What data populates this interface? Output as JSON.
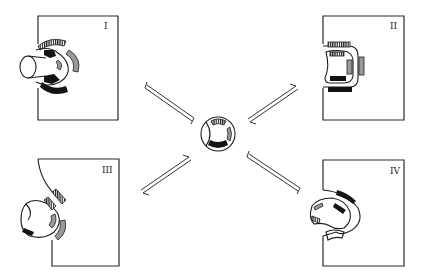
{
  "diagram": {
    "colors": {
      "ink": "#1e1e1e",
      "filled_dark": "#141414",
      "filled_grey": "#9a9a9a",
      "background": "#ffffff"
    },
    "center_node": {
      "label": "",
      "cx": 218,
      "cy": 134,
      "r": 17
    },
    "panels": [
      {
        "id": "I",
        "label": "I",
        "position": "top-left"
      },
      {
        "id": "II",
        "label": "II",
        "position": "top-right"
      },
      {
        "id": "III",
        "label": "III",
        "position": "bottom-left"
      },
      {
        "id": "IV",
        "label": "IV",
        "position": "bottom-right"
      }
    ],
    "arrows": [
      {
        "from": "center",
        "to": "I",
        "type": "reversible-equilibrium"
      },
      {
        "from": "center",
        "to": "II",
        "type": "reversible-equilibrium"
      },
      {
        "from": "center",
        "to": "III",
        "type": "reversible-equilibrium"
      },
      {
        "from": "center",
        "to": "IV",
        "type": "reversible-equilibrium"
      }
    ]
  }
}
